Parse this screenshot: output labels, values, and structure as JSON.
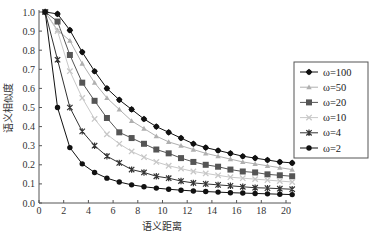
{
  "chart_data": {
    "type": "line",
    "title": "",
    "xlabel": "语义距离",
    "ylabel": "语义相似度",
    "xlim": [
      0,
      21
    ],
    "ylim": [
      0,
      1.0
    ],
    "xticks": [
      0,
      2,
      4,
      6,
      8,
      10,
      12,
      14,
      16,
      18,
      20
    ],
    "yticks": [
      0.0,
      0.1,
      0.2,
      0.3,
      0.4,
      0.5,
      0.6,
      0.7,
      0.8,
      0.9,
      1.0
    ],
    "ytick_labels": [
      "0.0",
      "0.1",
      "0.2",
      "0.3",
      "0.4",
      "0.5",
      "0.6",
      "0.7",
      "0.8",
      "0.9",
      "1.0"
    ],
    "grid": false,
    "legend_position": "right, outside plot",
    "x": [
      0.5,
      1.5,
      2.5,
      3.5,
      4.5,
      5.5,
      6.5,
      7.5,
      8.5,
      9.5,
      10.5,
      11.5,
      12.5,
      13.5,
      14.5,
      15.5,
      16.5,
      17.5,
      18.5,
      19.5,
      20.5
    ],
    "series": [
      {
        "name": "ω=100",
        "marker": "diamond",
        "color": "#111111",
        "values": [
          1.0,
          0.99,
          0.905,
          0.79,
          0.69,
          0.6,
          0.54,
          0.49,
          0.44,
          0.4,
          0.37,
          0.34,
          0.31,
          0.29,
          0.275,
          0.26,
          0.245,
          0.235,
          0.225,
          0.215,
          0.21
        ]
      },
      {
        "name": "ω=50",
        "marker": "triangle",
        "color": "#b0b0b0",
        "values": [
          1.0,
          0.905,
          0.85,
          0.73,
          0.63,
          0.55,
          0.49,
          0.43,
          0.39,
          0.35,
          0.32,
          0.3,
          0.28,
          0.26,
          0.245,
          0.23,
          0.215,
          0.205,
          0.195,
          0.185,
          0.175
        ]
      },
      {
        "name": "ω=20",
        "marker": "square",
        "color": "#555555",
        "values": [
          1.0,
          0.95,
          0.775,
          0.63,
          0.535,
          0.445,
          0.37,
          0.34,
          0.31,
          0.28,
          0.26,
          0.235,
          0.215,
          0.2,
          0.19,
          0.175,
          0.165,
          0.16,
          0.15,
          0.145,
          0.14
        ]
      },
      {
        "name": "ω=10",
        "marker": "x",
        "color": "#c8c8c8",
        "values": [
          1.0,
          0.9,
          0.69,
          0.55,
          0.44,
          0.36,
          0.31,
          0.27,
          0.24,
          0.215,
          0.195,
          0.18,
          0.165,
          0.155,
          0.145,
          0.135,
          0.13,
          0.125,
          0.12,
          0.115,
          0.11
        ]
      },
      {
        "name": "ω=4",
        "marker": "star",
        "color": "#333333",
        "values": [
          1.0,
          0.75,
          0.5,
          0.375,
          0.3,
          0.245,
          0.21,
          0.175,
          0.16,
          0.14,
          0.13,
          0.115,
          0.105,
          0.1,
          0.095,
          0.09,
          0.085,
          0.08,
          0.078,
          0.075,
          0.072
        ]
      },
      {
        "name": "ω=2",
        "marker": "circle",
        "color": "#111111",
        "values": [
          1.0,
          0.5,
          0.29,
          0.205,
          0.16,
          0.13,
          0.11,
          0.095,
          0.085,
          0.078,
          0.072,
          0.067,
          0.063,
          0.06,
          0.057,
          0.054,
          0.052,
          0.05,
          0.048,
          0.046,
          0.044
        ]
      }
    ]
  }
}
